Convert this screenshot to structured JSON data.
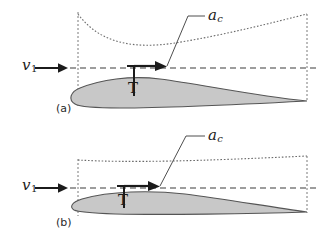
{
  "figure": {
    "background_color": "#ffffff",
    "airfoil_fill_color": "#c8c8c8",
    "airfoil_stroke_color": "#555555",
    "dashed_line_color": "#4a4a4a",
    "dotted_line_color": "#6b6b6b",
    "annotation_color": "#1b1b1b"
  },
  "panels": [
    {
      "id": "a",
      "caption": "(a)",
      "velocity_label": "v",
      "velocity_subscript": "1",
      "thickness_label": "T",
      "camber_label": "a",
      "camber_subscript": "c",
      "description": "Thick cambered airfoil with large camber line curvature"
    },
    {
      "id": "b",
      "caption": "(b)",
      "velocity_label": "v",
      "velocity_subscript": "1",
      "thickness_label": "T",
      "camber_label": "a",
      "camber_subscript": "c",
      "description": "Thin airfoil with small camber line curvature"
    }
  ]
}
